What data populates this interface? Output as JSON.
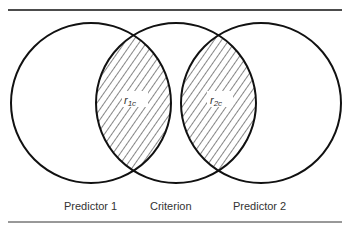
{
  "figure": {
    "type": "venn-diagram",
    "circles": [
      {
        "name": "Predictor 1",
        "cx": 91,
        "cy": 103,
        "r": 80
      },
      {
        "name": "Criterion",
        "cx": 176,
        "cy": 103,
        "r": 80
      },
      {
        "name": "Predictor 2",
        "cx": 261,
        "cy": 103,
        "r": 80
      }
    ],
    "overlaps": [
      {
        "label": "r",
        "subscript": "1c",
        "between": [
          "Predictor 1",
          "Criterion"
        ],
        "shaded": true
      },
      {
        "label": "r",
        "subscript": "2c",
        "between": [
          "Criterion",
          "Predictor 2"
        ],
        "shaded": true
      }
    ],
    "labels": {
      "predictor1": "Predictor 1",
      "criterion": "Criterion",
      "predictor2": "Predictor 2"
    },
    "colors": {
      "stroke": "#111111",
      "background": "#ffffff"
    }
  }
}
